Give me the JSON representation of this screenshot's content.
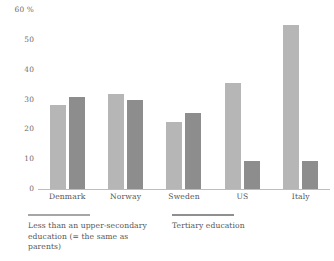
{
  "chart_data": {
    "type": "bar",
    "title": "",
    "xlabel": "",
    "ylabel": "60 %",
    "ylim": [
      0,
      60
    ],
    "grid": false,
    "legend_position": "bottom-left",
    "categories": [
      "Denmark",
      "Norway",
      "Sweden",
      "US",
      "Italy"
    ],
    "y_ticks": [
      "0",
      "10",
      "20",
      "30",
      "40",
      "50",
      "60 %"
    ],
    "y_tick_values": [
      0,
      10,
      20,
      30,
      40,
      50,
      60
    ],
    "series": [
      {
        "name": "Less than an upper-secondary education (= the same as parents)",
        "color": "#b6b6b6",
        "values": [
          28,
          32,
          22.5,
          35.5,
          55
        ]
      },
      {
        "name": "Tertiary education",
        "color": "#8d8d8d",
        "values": [
          31,
          30,
          25.5,
          9.5,
          9.5
        ]
      }
    ]
  }
}
